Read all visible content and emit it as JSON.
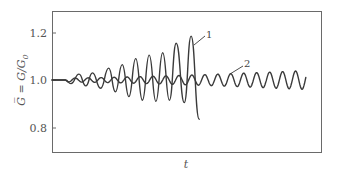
{
  "chart_data": {
    "type": "line",
    "title": "",
    "xlabel": "t",
    "ylabel": "G̅ = G/G₀",
    "ylabel_parts": {
      "main": "G = G/G",
      "subscript": "0"
    },
    "ylim": [
      0.69,
      1.29
    ],
    "xlim": [
      0,
      1
    ],
    "yticks": [
      0.8,
      1.0,
      1.2
    ],
    "ytick_labels": [
      "0.8",
      "1.0",
      "1.2"
    ],
    "xticks": [],
    "grid": false,
    "legend": "none (curves labeled inline)",
    "series": [
      {
        "name": "1",
        "description": "Growing oscillation (unstable), diverges and drops sharply",
        "baseline": 1.0,
        "flat_until_t": 0.05,
        "period_t": 0.05,
        "peaks": [
          {
            "t": 0.1,
            "y": 1.025
          },
          {
            "t": 0.15,
            "y": 1.03
          },
          {
            "t": 0.21,
            "y": 1.05
          },
          {
            "t": 0.26,
            "y": 1.065
          },
          {
            "t": 0.31,
            "y": 1.09
          },
          {
            "t": 0.36,
            "y": 1.105
          },
          {
            "t": 0.41,
            "y": 1.115
          },
          {
            "t": 0.46,
            "y": 1.155
          },
          {
            "t": 0.515,
            "y": 1.185
          }
        ],
        "troughs": [
          {
            "t": 0.07,
            "y": 0.985
          },
          {
            "t": 0.125,
            "y": 0.975
          },
          {
            "t": 0.18,
            "y": 0.965
          },
          {
            "t": 0.235,
            "y": 0.95
          },
          {
            "t": 0.285,
            "y": 0.93
          },
          {
            "t": 0.335,
            "y": 0.915
          },
          {
            "t": 0.385,
            "y": 0.91
          },
          {
            "t": 0.435,
            "y": 0.915
          },
          {
            "t": 0.49,
            "y": 0.905
          }
        ],
        "end": {
          "t": 0.545,
          "y": 0.835
        }
      },
      {
        "name": "2",
        "description": "Small oscillation (stable/marginal), slowly growing amplitude",
        "baseline": 1.0,
        "flat_until_t": 0.05,
        "period_t": 0.048,
        "amplitude_start": 0.008,
        "amplitude_end": 0.04,
        "end_t": 0.94,
        "end_y": 1.02
      }
    ],
    "annotations": [
      {
        "text": "1",
        "target_series": "1",
        "label_t": 0.57,
        "label_y": 1.195
      },
      {
        "text": "2",
        "target_series": "2",
        "label_t": 0.74,
        "label_y": 1.075
      }
    ]
  },
  "plot_area": {
    "left": 52,
    "top": 11,
    "right": 322,
    "bottom": 153
  },
  "labels": {
    "xlabel": "t",
    "ylabel_main": "G̅ = G/G",
    "ylabel_sub": "0",
    "curve1": "1",
    "curve2": "2",
    "yticks": [
      "1.2",
      "1.0",
      "0.8"
    ]
  }
}
